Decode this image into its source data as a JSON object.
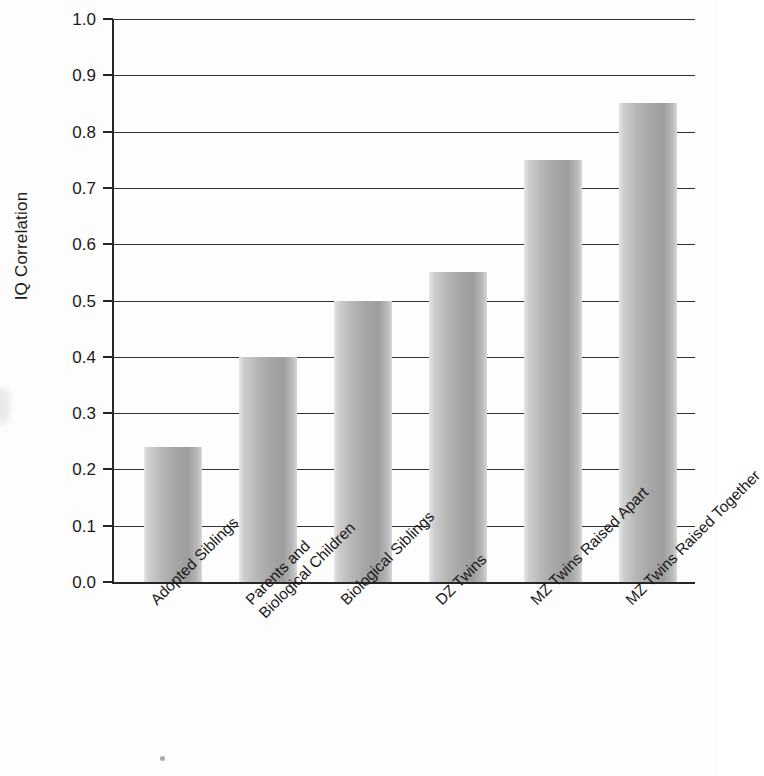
{
  "chart_data": {
    "type": "bar",
    "title": "",
    "xlabel": "",
    "ylabel": "IQ Correlation",
    "ylim": [
      0.0,
      1.0
    ],
    "grid": true,
    "legend": "none",
    "categories": [
      "Adopted Siblings",
      "Parents and\nBiological Children",
      "Biological Siblings",
      "DZ Twins",
      "MZ Twins Raised Apart",
      "MZ Twins Raised Together"
    ],
    "values": [
      0.24,
      0.4,
      0.5,
      0.55,
      0.75,
      0.85
    ],
    "ytick_labels": [
      "0.0",
      "0.1",
      "0.2",
      "0.3",
      "0.4",
      "0.5",
      "0.6",
      "0.7",
      "0.8",
      "0.9",
      "1.0"
    ],
    "ytick_values": [
      0.0,
      0.1,
      0.2,
      0.3,
      0.4,
      0.5,
      0.6,
      0.7,
      0.8,
      0.9,
      1.0
    ]
  },
  "colors": {
    "bar_light": "#e6e6e6",
    "bar_mid": "#b6b6b6",
    "bar_dark": "#9d9d9d",
    "axis": "#262626",
    "grid": "#333333",
    "background": "#fdfdfd",
    "text": "#1a1a1a"
  }
}
